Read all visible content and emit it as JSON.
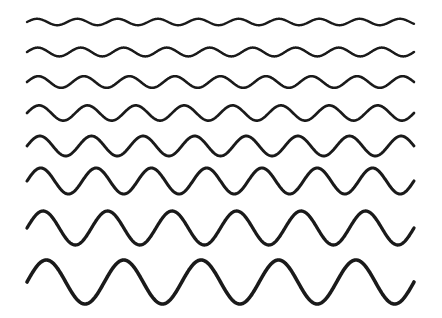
{
  "figure": {
    "width": 442,
    "height": 318,
    "background_color": "#ffffff",
    "stroke_color": "#1a1a1a"
  },
  "chart_data": {
    "type": "line",
    "title": "",
    "xlabel": "",
    "ylabel": "",
    "grid": false,
    "legend": "none",
    "axis_visible": false,
    "x_start": 27,
    "x_end": 414,
    "xlim": [
      0,
      442
    ],
    "ylim": [
      318,
      0
    ],
    "series": [
      {
        "name": "wave-1",
        "baseline_y": 22,
        "amplitude": 3.2,
        "cycles": 9.6,
        "wavelength": 40.3,
        "phase": 0,
        "stroke_width": 2.4,
        "color": "#1a1a1a"
      },
      {
        "name": "wave-2",
        "baseline_y": 52,
        "amplitude": 4.4,
        "cycles": 9.0,
        "wavelength": 43.0,
        "phase": 0,
        "stroke_width": 2.5,
        "color": "#1a1a1a"
      },
      {
        "name": "wave-3",
        "baseline_y": 82,
        "amplitude": 5.8,
        "cycles": 8.5,
        "wavelength": 45.6,
        "phase": 0,
        "stroke_width": 2.6,
        "color": "#1a1a1a"
      },
      {
        "name": "wave-4",
        "baseline_y": 113,
        "amplitude": 7.6,
        "cycles": 8.0,
        "wavelength": 48.4,
        "phase": 0,
        "stroke_width": 2.7,
        "color": "#1a1a1a"
      },
      {
        "name": "wave-5",
        "baseline_y": 146,
        "amplitude": 10.0,
        "cycles": 7.5,
        "wavelength": 51.7,
        "phase": 0,
        "stroke_width": 2.9,
        "color": "#1a1a1a"
      },
      {
        "name": "wave-6",
        "baseline_y": 181,
        "amplitude": 13.0,
        "cycles": 7.0,
        "wavelength": 55.4,
        "phase": 0,
        "stroke_width": 3.1,
        "color": "#1a1a1a"
      },
      {
        "name": "wave-7",
        "baseline_y": 228,
        "amplitude": 17.0,
        "cycles": 6.0,
        "wavelength": 64.6,
        "phase": 0,
        "stroke_width": 3.3,
        "color": "#1a1a1a"
      },
      {
        "name": "wave-8",
        "baseline_y": 282,
        "amplitude": 22.0,
        "cycles": 5.0,
        "wavelength": 77.6,
        "phase": 0,
        "stroke_width": 3.6,
        "color": "#1a1a1a"
      }
    ]
  }
}
